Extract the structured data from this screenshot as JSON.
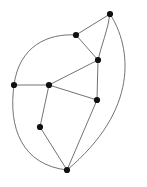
{
  "figure": {
    "kind": "planar-graph-drawing",
    "width": 147,
    "height": 187,
    "background_color": "#ffffff",
    "edge_color": "#5a5a5a",
    "node_color": "#101010",
    "node_radius": 3.1,
    "edge_width": 0.85
  },
  "caption": {
    "text": "",
    "top": 177,
    "color": "#d8d8d8"
  },
  "chart_data": {
    "type": "diagram",
    "title": "",
    "xlabel": "",
    "ylabel": "",
    "node_count": 8,
    "edge_count": 13,
    "nodes": [
      {
        "id": "n1",
        "label": "",
        "x": 110,
        "y": 14,
        "degree": 3
      },
      {
        "id": "n2",
        "label": "",
        "x": 76,
        "y": 35,
        "degree": 3
      },
      {
        "id": "n3",
        "label": "",
        "x": 98,
        "y": 60,
        "degree": 4
      },
      {
        "id": "n4",
        "label": "",
        "x": 14,
        "y": 85,
        "degree": 3
      },
      {
        "id": "n5",
        "label": "",
        "x": 49,
        "y": 85,
        "degree": 4
      },
      {
        "id": "n6",
        "label": "",
        "x": 97,
        "y": 100,
        "degree": 3
      },
      {
        "id": "n7",
        "label": "",
        "x": 40,
        "y": 127,
        "degree": 2
      },
      {
        "id": "n8",
        "label": "",
        "x": 67,
        "y": 170,
        "degree": 5
      }
    ],
    "edges": [
      {
        "id": "e1",
        "from": "n1",
        "to": "n2",
        "shape": "line",
        "path": "M110,14 L76,35"
      },
      {
        "id": "e2",
        "from": "n1",
        "to": "n3",
        "shape": "curve",
        "path": "M110,14 C108,30 101,46 98,60"
      },
      {
        "id": "e3",
        "from": "n1",
        "to": "n8",
        "shape": "curve",
        "path": "M110,14 C132,48 139,110 67,170"
      },
      {
        "id": "e4",
        "from": "n2",
        "to": "n3",
        "shape": "line",
        "path": "M76,35 L98,60"
      },
      {
        "id": "e5",
        "from": "n2",
        "to": "n4",
        "shape": "curve",
        "path": "M76,35 C48,33 19,46 14,85"
      },
      {
        "id": "e6",
        "from": "n3",
        "to": "n5",
        "shape": "line",
        "path": "M98,60 L49,85"
      },
      {
        "id": "e7",
        "from": "n3",
        "to": "n6",
        "shape": "line",
        "path": "M98,60 L97,100"
      },
      {
        "id": "e8",
        "from": "n4",
        "to": "n5",
        "shape": "line",
        "path": "M14,85 L49,85"
      },
      {
        "id": "e9",
        "from": "n4",
        "to": "n8",
        "shape": "curve",
        "path": "M14,85 C8,128 22,165 67,170"
      },
      {
        "id": "e10",
        "from": "n5",
        "to": "n6",
        "shape": "line",
        "path": "M49,85 L97,100"
      },
      {
        "id": "e11",
        "from": "n5",
        "to": "n7",
        "shape": "line",
        "path": "M49,85 L40,127"
      },
      {
        "id": "e12",
        "from": "n6",
        "to": "n8",
        "shape": "line",
        "path": "M97,100 L67,170"
      },
      {
        "id": "e13",
        "from": "n7",
        "to": "n8",
        "shape": "line",
        "path": "M40,127 L67,170"
      }
    ]
  }
}
